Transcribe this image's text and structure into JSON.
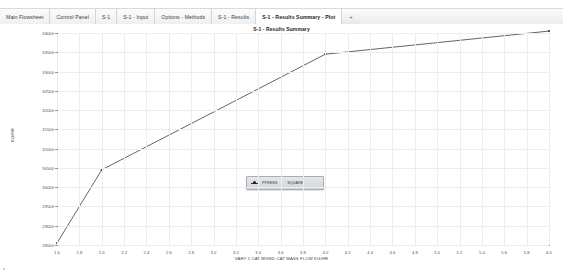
{
  "tabs": [
    {
      "label": "Main Flowsheet",
      "active": false
    },
    {
      "label": "Control Panel",
      "active": false
    },
    {
      "label": "S-1",
      "active": false
    },
    {
      "label": "S-1 - Input",
      "active": false
    },
    {
      "label": "Options - Methods",
      "active": false
    },
    {
      "label": "S-1 - Results",
      "active": false
    },
    {
      "label": "S-1 - Results Summary - Plot",
      "active": true
    }
  ],
  "add_tab": {
    "label": "+",
    "icon": "plus-icon"
  },
  "legend": {
    "marker_icon": "line-marker-icon",
    "series_label": "PPRESS",
    "value_label": "SQUARE"
  },
  "chart_data": {
    "type": "line",
    "title": "S-1 - Results Summary",
    "xlabel": "VARY 1 CAT MIXED CAT MASS FLOW KG/HR",
    "ylabel": "KG/HR",
    "xlim": [
      1.6,
      6.0
    ],
    "ylim": [
      28500,
      34000
    ],
    "grid": true,
    "legend_position": "center",
    "xticks": [
      1.6,
      1.8,
      2.0,
      2.2,
      2.4,
      2.6,
      2.8,
      3.0,
      3.2,
      3.4,
      3.6,
      3.8,
      4.0,
      4.2,
      4.4,
      4.6,
      4.8,
      5.0,
      5.2,
      5.4,
      5.6,
      5.8,
      6.0
    ],
    "xtick_labels": [
      "1.6",
      "1.8",
      "2.0",
      "2.2",
      "2.4",
      "2.6",
      "2.8",
      "3.0",
      "3.2",
      "3.4",
      "3.6",
      "3.8",
      "4.0",
      "4.2",
      "4.4",
      "4.6",
      "4.8",
      "5.0",
      "5.2",
      "5.4",
      "5.6",
      "5.8",
      "6.0"
    ],
    "yticks": [
      28500,
      29000,
      29500,
      30000,
      30500,
      31000,
      31500,
      32000,
      32500,
      33000,
      33500,
      34000
    ],
    "ytick_labels": [
      "28500",
      "29000",
      "29500",
      "30000",
      "30500",
      "31000",
      "31500",
      "32000",
      "32500",
      "33000",
      "33500",
      "34000"
    ],
    "series": [
      {
        "name": "PPRESS",
        "color": "#3a3e42",
        "x": [
          1.6,
          2.0,
          4.0,
          6.0
        ],
        "values": [
          28550,
          30450,
          33450,
          34050
        ]
      }
    ]
  }
}
